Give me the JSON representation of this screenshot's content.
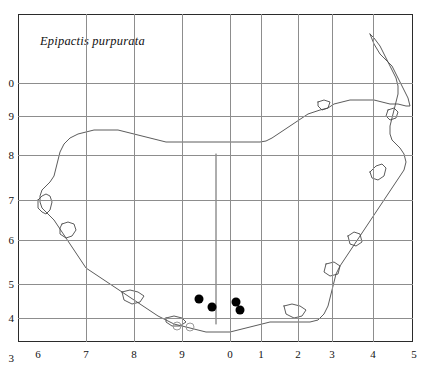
{
  "figure": {
    "species_label": "Epipactis purpurata",
    "frame": {
      "left": 18,
      "top": 14,
      "width": 395,
      "height": 328
    }
  },
  "axes": {
    "x_ticks": [
      {
        "label": "6",
        "x": 20
      },
      {
        "label": "7",
        "x": 68
      },
      {
        "label": "8",
        "x": 116
      },
      {
        "label": "9",
        "x": 164
      },
      {
        "label": "0",
        "x": 212
      },
      {
        "label": "1",
        "x": 243
      },
      {
        "label": "2",
        "x": 280
      },
      {
        "label": "3",
        "x": 314
      },
      {
        "label": "4",
        "x": 355
      },
      {
        "label": "5",
        "x": 396
      }
    ],
    "y_ticks": [
      {
        "label": "0",
        "y": 69
      },
      {
        "label": "9",
        "y": 102
      },
      {
        "label": "8",
        "y": 141
      },
      {
        "label": "7",
        "y": 186
      },
      {
        "label": "6",
        "y": 226
      },
      {
        "label": "5",
        "y": 270
      },
      {
        "label": "4",
        "y": 304
      },
      {
        "label": "3",
        "y": 344
      }
    ]
  },
  "gridlines": {
    "vertical_x": [
      68,
      116,
      164,
      212,
      243,
      280,
      314,
      355
    ],
    "horizontal_y": [
      69,
      102,
      141,
      186,
      226,
      270,
      304
    ]
  },
  "records": {
    "filled_label": "filled-record",
    "open_label": "open-record",
    "filled": [
      {
        "x": 181,
        "y": 285
      },
      {
        "x": 194,
        "y": 293
      },
      {
        "x": 218,
        "y": 288
      },
      {
        "x": 222,
        "y": 296
      }
    ],
    "open": [
      {
        "x": 159,
        "y": 312
      },
      {
        "x": 172,
        "y": 313
      }
    ]
  },
  "colors": {
    "frame": "#2b2b2b",
    "grid": "#8d8d8d",
    "coast": "#4a4a4a",
    "dot": "#000000",
    "open_dot": "#9a9a9a",
    "background": "#ffffff"
  }
}
